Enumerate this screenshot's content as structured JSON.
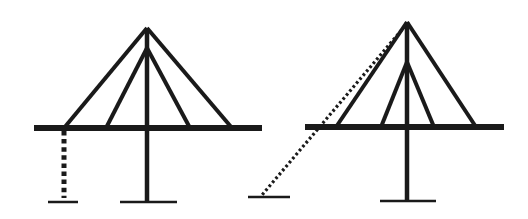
{
  "diagram": {
    "type": "cable-stayed-bridge-comparison",
    "colors": {
      "line": "#1a1a1a",
      "background": "#ffffff"
    },
    "figures": [
      {
        "id": "left",
        "deck": {
          "x1": 34,
          "x2": 262,
          "y": 128
        },
        "tower": {
          "x": 147,
          "top": 28,
          "bottom": 201
        },
        "inner_apex": {
          "x": 147,
          "y": 48
        },
        "cables": [
          {
            "from": [
              147,
              28
            ],
            "to": [
              64,
              128
            ]
          },
          {
            "from": [
              147,
              28
            ],
            "to": [
              232,
              128
            ]
          },
          {
            "from": [
              147,
              48
            ],
            "to": [
              106,
              128
            ]
          },
          {
            "from": [
              147,
              48
            ],
            "to": [
              190,
              128
            ]
          }
        ],
        "dotted_support": {
          "kind": "vertical-pier",
          "from": [
            64,
            131
          ],
          "to": [
            64,
            198
          ]
        },
        "ground_lines": [
          {
            "x1": 48,
            "x2": 78,
            "y": 202
          },
          {
            "x1": 120,
            "x2": 177,
            "y": 202
          }
        ]
      },
      {
        "id": "right",
        "deck": {
          "x1": 305,
          "x2": 504,
          "y": 127
        },
        "tower": {
          "x": 407,
          "top": 22,
          "bottom": 201
        },
        "inner_apex": {
          "x": 407,
          "y": 62
        },
        "cables": [
          {
            "from": [
              407,
              22
            ],
            "to": [
              336,
              127
            ]
          },
          {
            "from": [
              407,
              22
            ],
            "to": [
              476,
              127
            ]
          },
          {
            "from": [
              407,
              62
            ],
            "to": [
              381,
              127
            ]
          },
          {
            "from": [
              407,
              62
            ],
            "to": [
              434,
              127
            ]
          }
        ],
        "dotted_support": {
          "kind": "diagonal-backstay",
          "from": [
            405,
            26
          ],
          "to": [
            262,
            195
          ]
        },
        "ground_lines": [
          {
            "x1": 248,
            "x2": 290,
            "y": 197
          },
          {
            "x1": 380,
            "x2": 436,
            "y": 201
          }
        ]
      }
    ]
  }
}
